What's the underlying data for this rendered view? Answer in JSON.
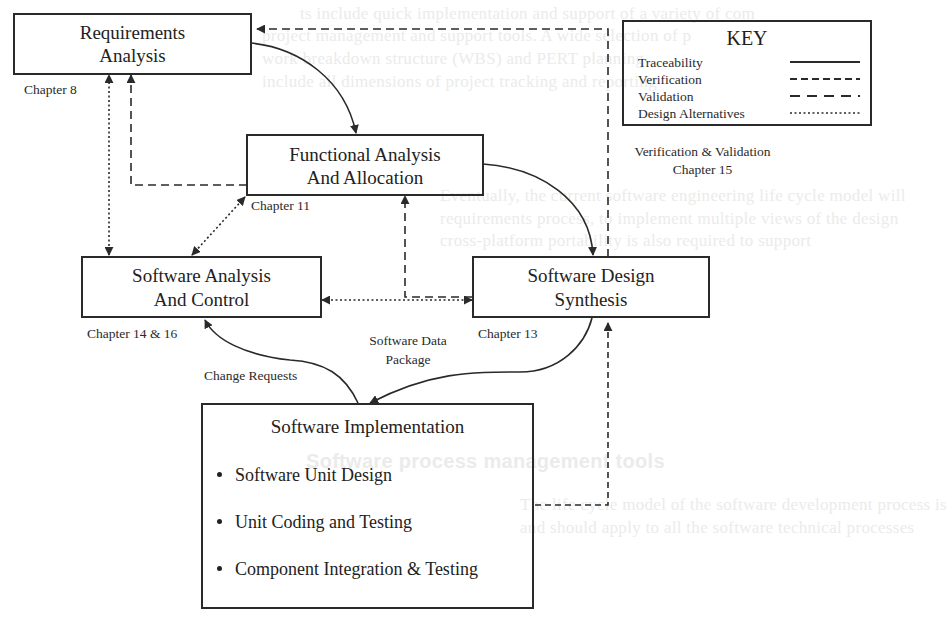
{
  "diagram": {
    "type": "process-flow",
    "nodes": {
      "requirements": {
        "line1": "Requirements",
        "line2": "Analysis",
        "chapter": "Chapter 8"
      },
      "functional": {
        "line1": "Functional Analysis",
        "line2": "And Allocation",
        "chapter": "Chapter 11"
      },
      "analysis_control": {
        "line1": "Software Analysis",
        "line2": "And Control",
        "chapter": "Chapter 14 & 16"
      },
      "design_synthesis": {
        "line1": "Software Design",
        "line2": "Synthesis",
        "chapter": "Chapter 13"
      },
      "implementation": {
        "title": "Software Implementation",
        "items": [
          "Software Unit Design",
          "Unit Coding and Testing",
          "Component Integration & Testing"
        ]
      }
    },
    "edge_labels": {
      "change_requests": "Change Requests",
      "data_package_line1": "Software Data",
      "data_package_line2": "Package",
      "vv_line1": "Verification & Validation",
      "vv_line2": "Chapter 15"
    },
    "key": {
      "title": "KEY",
      "entries": [
        {
          "label": "Traceability",
          "style": "solid"
        },
        {
          "label": "Verification",
          "style": "short-dash"
        },
        {
          "label": "Validation",
          "style": "long-dash"
        },
        {
          "label": "Design Alternatives",
          "style": "dotted"
        }
      ]
    },
    "edges": [
      {
        "from": "requirements",
        "to": "functional",
        "style": "solid"
      },
      {
        "from": "functional",
        "to": "design_synthesis",
        "style": "solid"
      },
      {
        "from": "design_synthesis",
        "to": "implementation",
        "style": "solid",
        "label": "Software Data Package"
      },
      {
        "from": "implementation",
        "to": "analysis_control",
        "style": "solid",
        "label": "Change Requests"
      },
      {
        "from": "functional",
        "to": "requirements",
        "style": "dashed"
      },
      {
        "from": "design_synthesis",
        "to": "functional",
        "style": "dashed"
      },
      {
        "from": "implementation",
        "to": "design_synthesis",
        "style": "dashed"
      },
      {
        "from": "design_synthesis",
        "to": "requirements",
        "style": "dashed",
        "label": "Verification & Validation Chapter 15"
      },
      {
        "from": "analysis_control",
        "to": "requirements",
        "style": "dotted",
        "bidirectional": true
      },
      {
        "from": "analysis_control",
        "to": "functional",
        "style": "dotted",
        "bidirectional": true
      },
      {
        "from": "analysis_control",
        "to": "design_synthesis",
        "style": "dotted",
        "bidirectional": true
      }
    ]
  },
  "background_showthrough": [
    "ts include quick implementation and support of a variety of com",
    "project management and support tools. A wide selection of p",
    "work breakdown structure (WBS) and PERT planning",
    "include all dimensions of project tracking and reporting",
    "Eventually, the current software engineering life cycle model will",
    "requirements process, to implement multiple views of the design",
    "cross-platform portability is also required to support",
    "Software process management tools",
    "The life cycle model of the software development process is",
    "and should apply to all the software technical processes"
  ],
  "colors": {
    "ink": "#2a2a2a",
    "background": "#ffffff",
    "showthrough": "#ebebeb"
  }
}
